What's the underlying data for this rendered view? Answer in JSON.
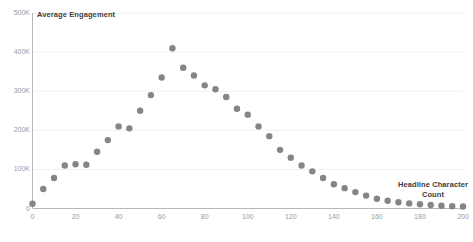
{
  "chart_data": {
    "type": "scatter",
    "title": "",
    "xlabel": "Headline Character Count",
    "ylabel": "Average Engagement",
    "xlim": [
      0,
      200
    ],
    "ylim": [
      0,
      500000
    ],
    "grid": true,
    "legend": "none",
    "marker_color": "#7b7b7b",
    "axis_color": "#b7b7b7",
    "grid_color": "#f0f0f0",
    "tick_color": "#9a9a9a",
    "xticks": [
      0,
      20,
      40,
      60,
      80,
      100,
      120,
      140,
      160,
      180,
      200
    ],
    "xtick_labels": [
      "0",
      "20",
      "40",
      "60",
      "80",
      "100",
      "120",
      "140",
      "160",
      "180",
      "200"
    ],
    "yticks": [
      0,
      100000,
      200000,
      300000,
      400000,
      500000
    ],
    "ytick_labels": [
      "0",
      "100K",
      "200K",
      "300K",
      "400K",
      "500K"
    ],
    "x": [
      0,
      5,
      10,
      15,
      20,
      25,
      30,
      35,
      40,
      45,
      50,
      55,
      60,
      65,
      70,
      75,
      80,
      85,
      90,
      95,
      100,
      105,
      110,
      115,
      120,
      125,
      130,
      135,
      140,
      145,
      150,
      155,
      160,
      165,
      170,
      175,
      180,
      185,
      190,
      195,
      200
    ],
    "values": [
      12000,
      50000,
      78000,
      110000,
      113000,
      112000,
      145000,
      175000,
      210000,
      205000,
      250000,
      290000,
      335000,
      410000,
      360000,
      340000,
      315000,
      305000,
      285000,
      255000,
      240000,
      210000,
      185000,
      150000,
      130000,
      110000,
      95000,
      78000,
      62000,
      52000,
      42000,
      33000,
      25000,
      20000,
      16000,
      13000,
      11000,
      9000,
      7000,
      6000,
      5000
    ]
  }
}
